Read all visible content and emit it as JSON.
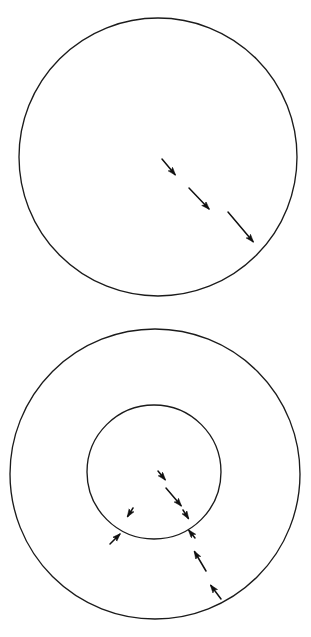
{
  "document": {
    "background_color": "#ffffff",
    "ink_color": "#1b1b1b",
    "width": 311,
    "height": 637,
    "panel_count": 2
  },
  "chart_data": {
    "type": "diagram",
    "title": "",
    "subtitle": "",
    "xlabel": "",
    "ylabel": "",
    "grid": false,
    "legend": "none",
    "panels": [
      {
        "id": "panel-top",
        "label": "",
        "shapes": [
          {
            "name": "outer-circle",
            "type": "circle",
            "cx": 158,
            "cy": 157,
            "r": 139,
            "stroke": "#1b1b1b",
            "fill": "none"
          }
        ],
        "arrows": [
          {
            "name": "flux-arrow-1",
            "x1": 162,
            "y1": 159,
            "x2": 177,
            "y2": 177,
            "direction": "down-right",
            "length": 23
          },
          {
            "name": "flux-arrow-2",
            "x1": 189,
            "y1": 188,
            "x2": 211,
            "y2": 211,
            "direction": "down-right",
            "length": 32
          },
          {
            "name": "flux-arrow-3",
            "x1": 228,
            "y1": 212,
            "x2": 255,
            "y2": 244,
            "direction": "down-right",
            "length": 42
          }
        ]
      },
      {
        "id": "panel-bottom",
        "label": "",
        "shapes": [
          {
            "name": "outer-circle",
            "type": "circle",
            "cx": 155,
            "cy": 156,
            "r": 145,
            "stroke": "#1b1b1b",
            "fill": "none"
          },
          {
            "name": "inner-circle",
            "type": "circle",
            "cx": 154,
            "cy": 154,
            "r": 67,
            "stroke": "#1b1b1b",
            "fill": "none"
          }
        ],
        "arrows": [
          {
            "name": "inner-flux-arrow-1",
            "x1": 158,
            "y1": 153,
            "x2": 167,
            "y2": 164,
            "direction": "down-right",
            "length": 14
          },
          {
            "name": "inner-flux-arrow-2",
            "x1": 166,
            "y1": 170,
            "x2": 183,
            "y2": 190,
            "direction": "down-right",
            "length": 26
          },
          {
            "name": "inner-flux-arrow-3",
            "x1": 183,
            "y1": 192,
            "x2": 190,
            "y2": 203,
            "direction": "down-right",
            "length": 13
          },
          {
            "name": "inner-flux-arrow-4",
            "x1": 133,
            "y1": 190,
            "x2": 126,
            "y2": 201,
            "direction": "down-left",
            "length": 13
          },
          {
            "name": "outer-flux-arrow-left",
            "x1": 110,
            "y1": 226,
            "x2": 122,
            "y2": 214,
            "direction": "up-right",
            "length": 17
          },
          {
            "name": "outer-flux-arrow-1",
            "x1": 195,
            "y1": 220,
            "x2": 187,
            "y2": 210,
            "direction": "up-left",
            "length": 13
          },
          {
            "name": "outer-flux-arrow-2",
            "x1": 206,
            "y1": 253,
            "x2": 193,
            "y2": 231,
            "direction": "up-left",
            "length": 26
          },
          {
            "name": "outer-flux-arrow-3",
            "x1": 221,
            "y1": 281,
            "x2": 209,
            "y2": 265,
            "direction": "up-left",
            "length": 20
          }
        ]
      }
    ]
  }
}
